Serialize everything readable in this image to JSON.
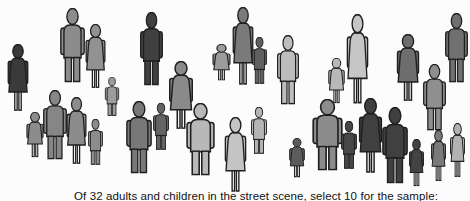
{
  "scene": {
    "caption": "Of 32 adults and children in the street scene, select 10 for the sample:",
    "background": "#fcfcfc",
    "outline_color": "#1f1f1f",
    "leg_skin_color": "#f2f2f2"
  },
  "figures": [
    {
      "kind": "woman",
      "x": 5,
      "y": 44,
      "w": 26,
      "h": 68,
      "color": "#3a3a3a"
    },
    {
      "kind": "man",
      "x": 59,
      "y": 8,
      "w": 27,
      "h": 75,
      "color": "#8c8c8c"
    },
    {
      "kind": "woman",
      "x": 83,
      "y": 24,
      "w": 25,
      "h": 65,
      "color": "#929292"
    },
    {
      "kind": "boy",
      "x": 104,
      "y": 77,
      "w": 16,
      "h": 39,
      "color": "#9c9c9c"
    },
    {
      "kind": "man",
      "x": 139,
      "y": 12,
      "w": 25,
      "h": 74,
      "color": "#404040"
    },
    {
      "kind": "woman",
      "x": 166,
      "y": 61,
      "w": 30,
      "h": 69,
      "color": "#8a8a8a"
    },
    {
      "kind": "girl",
      "x": 210,
      "y": 44,
      "w": 23,
      "h": 37,
      "color": "#9c9c9c"
    },
    {
      "kind": "woman",
      "x": 230,
      "y": 7,
      "w": 26,
      "h": 79,
      "color": "#7a7a7a"
    },
    {
      "kind": "boy",
      "x": 251,
      "y": 37,
      "w": 17,
      "h": 47,
      "color": "#606060"
    },
    {
      "kind": "man",
      "x": 276,
      "y": 35,
      "w": 24,
      "h": 70,
      "color": "#bdbdbd"
    },
    {
      "kind": "girl",
      "x": 326,
      "y": 58,
      "w": 21,
      "h": 46,
      "color": "#b8b8b8"
    },
    {
      "kind": "woman",
      "x": 344,
      "y": 14,
      "w": 27,
      "h": 91,
      "color": "#c6c6c6"
    },
    {
      "kind": "woman",
      "x": 394,
      "y": 34,
      "w": 28,
      "h": 68,
      "color": "#6d6d6d"
    },
    {
      "kind": "man",
      "x": 422,
      "y": 64,
      "w": 25,
      "h": 67,
      "color": "#8f8f8f"
    },
    {
      "kind": "man",
      "x": 444,
      "y": 13,
      "w": 25,
      "h": 70,
      "color": "#707070"
    },
    {
      "kind": "girl",
      "x": 24,
      "y": 112,
      "w": 22,
      "h": 46,
      "color": "#8c8c8c"
    },
    {
      "kind": "man",
      "x": 42,
      "y": 90,
      "w": 26,
      "h": 70,
      "color": "#868686"
    },
    {
      "kind": "woman",
      "x": 64,
      "y": 97,
      "w": 25,
      "h": 68,
      "color": "#8c8c8c"
    },
    {
      "kind": "boy",
      "x": 87,
      "y": 119,
      "w": 17,
      "h": 46,
      "color": "#8c8c8c"
    },
    {
      "kind": "man",
      "x": 125,
      "y": 101,
      "w": 28,
      "h": 73,
      "color": "#787878"
    },
    {
      "kind": "boy",
      "x": 152,
      "y": 103,
      "w": 18,
      "h": 47,
      "color": "#646464"
    },
    {
      "kind": "man",
      "x": 185,
      "y": 103,
      "w": 31,
      "h": 73,
      "color": "#b8b8b8"
    },
    {
      "kind": "woman",
      "x": 222,
      "y": 117,
      "w": 27,
      "h": 76,
      "color": "#c4c4c4"
    },
    {
      "kind": "boy",
      "x": 250,
      "y": 107,
      "w": 18,
      "h": 47,
      "color": "#b5b5b5"
    },
    {
      "kind": "girl",
      "x": 287,
      "y": 138,
      "w": 20,
      "h": 40,
      "color": "#5c5c5c"
    },
    {
      "kind": "man",
      "x": 311,
      "y": 99,
      "w": 33,
      "h": 72,
      "color": "#8c8c8c"
    },
    {
      "kind": "boy",
      "x": 340,
      "y": 121,
      "w": 18,
      "h": 48,
      "color": "#474747"
    },
    {
      "kind": "woman",
      "x": 356,
      "y": 98,
      "w": 29,
      "h": 76,
      "color": "#404040"
    },
    {
      "kind": "man",
      "x": 381,
      "y": 107,
      "w": 28,
      "h": 77,
      "color": "#404040"
    },
    {
      "kind": "girl",
      "x": 407,
      "y": 139,
      "w": 19,
      "h": 48,
      "color": "#434343"
    },
    {
      "kind": "girl",
      "x": 429,
      "y": 130,
      "w": 19,
      "h": 52,
      "color": "#7a7a7a"
    },
    {
      "kind": "girl",
      "x": 448,
      "y": 123,
      "w": 19,
      "h": 55,
      "color": "#b2b2b2"
    }
  ]
}
